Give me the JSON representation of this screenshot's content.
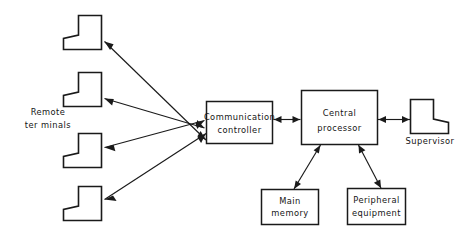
{
  "diagram": {
    "background_color": "#ffffff",
    "line_color": "#1a1a1a",
    "nodes": {
      "communication_controller": {
        "label_line1": "Communication",
        "label_line2": "controller",
        "shape": "rectangle"
      },
      "central_processor": {
        "label_line1": "Central",
        "label_line2": "processor",
        "shape": "rectangle"
      },
      "main_memory": {
        "label_line1": "Main",
        "label_line2": "memory",
        "shape": "rectangle"
      },
      "peripheral_equipment": {
        "label_line1": "Peripheral",
        "label_line2": "equipment",
        "shape": "rectangle"
      },
      "supervisor": {
        "label": "Supervisor",
        "shape": "terminal-mirrored"
      },
      "remote_terminals": {
        "label_line1": "Remote",
        "label_line2": "ter minals",
        "count": 4,
        "shape": "terminal"
      }
    },
    "connections": [
      {
        "from": "remote_terminal_1",
        "to": "communication_controller",
        "direction": "one-way"
      },
      {
        "from": "remote_terminal_2",
        "to": "communication_controller",
        "direction": "one-way"
      },
      {
        "from": "remote_terminal_3",
        "to": "communication_controller",
        "direction": "one-way"
      },
      {
        "from": "remote_terminal_4",
        "to": "communication_controller",
        "direction": "one-way"
      },
      {
        "from": "communication_controller",
        "to": "central_processor",
        "direction": "two-way"
      },
      {
        "from": "central_processor",
        "to": "supervisor",
        "direction": "two-way"
      },
      {
        "from": "central_processor",
        "to": "main_memory",
        "direction": "two-way"
      },
      {
        "from": "central_processor",
        "to": "peripheral_equipment",
        "direction": "two-way"
      }
    ]
  }
}
